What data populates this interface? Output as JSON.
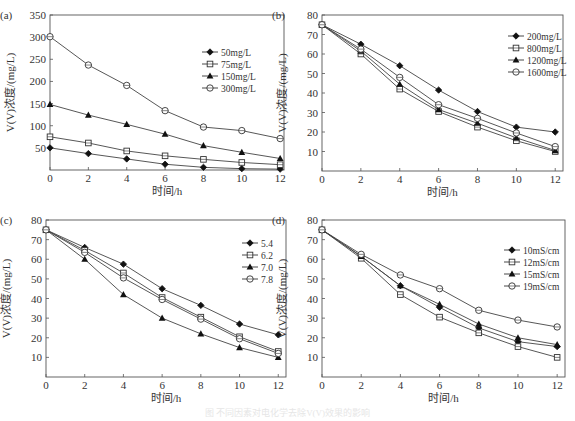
{
  "figure": {
    "caption": "图 不同因素对电化学去除V(V)效果的影响"
  },
  "chart_data": [
    {
      "type": "line",
      "panel_label": "(a)",
      "title": "",
      "xlabel": "时间/h",
      "ylabel": "V(V)浓度/(mg/L)",
      "x": [
        0,
        2,
        4,
        6,
        8,
        10,
        12
      ],
      "xticks": [
        0,
        2,
        4,
        6,
        8,
        10,
        12
      ],
      "yticks": [
        50,
        100,
        150,
        200,
        250,
        300,
        350
      ],
      "xlim": [
        0,
        12.2
      ],
      "ylim": [
        0,
        350
      ],
      "grid": false,
      "legend_position": "upper right",
      "box": {
        "left": 50,
        "top": 15,
        "right": 284,
        "bottom": 170
      },
      "legend_box": {
        "x": 202,
        "y": 52
      },
      "series": [
        {
          "name": "50mg/L",
          "marker": "diamond-filled",
          "values": [
            50,
            37,
            25,
            13,
            6,
            3,
            2
          ]
        },
        {
          "name": "75mg/L",
          "marker": "square-open",
          "values": [
            75,
            61,
            43,
            32,
            24,
            17,
            12
          ]
        },
        {
          "name": "150mg/L",
          "marker": "triangle-filled",
          "values": [
            148,
            124,
            103,
            81,
            55,
            40,
            26
          ]
        },
        {
          "name": "300mg/L",
          "marker": "circle-open",
          "values": [
            301,
            237,
            191,
            134,
            97,
            89,
            71
          ]
        }
      ]
    },
    {
      "type": "line",
      "panel_label": "(b)",
      "title": "",
      "xlabel": "时间/h",
      "ylabel": "V(V)浓度/(mg/L)",
      "x": [
        0,
        2,
        4,
        6,
        8,
        10,
        12
      ],
      "xticks": [
        0,
        2,
        4,
        6,
        8,
        10,
        12
      ],
      "yticks": [
        10,
        20,
        30,
        40,
        50,
        60,
        70,
        80
      ],
      "xlim": [
        0,
        12.4
      ],
      "ylim": [
        0,
        80
      ],
      "grid": false,
      "legend_position": "upper right",
      "box": {
        "left": 322,
        "top": 15,
        "right": 563,
        "bottom": 171
      },
      "legend_box": {
        "x": 508,
        "y": 36
      },
      "series": [
        {
          "name": "200mg/L",
          "marker": "diamond-filled",
          "values": [
            75,
            65,
            54,
            41.5,
            30.5,
            22.5,
            20
          ]
        },
        {
          "name": "800mg/L",
          "marker": "square-open",
          "values": [
            75,
            60,
            42,
            30.5,
            22.5,
            15.5,
            10
          ]
        },
        {
          "name": "1200mg/L",
          "marker": "triangle-filled",
          "values": [
            75,
            61.5,
            44.5,
            31.5,
            24.5,
            17,
            10.5
          ]
        },
        {
          "name": "1600mg/L",
          "marker": "circle-open",
          "values": [
            75,
            62.5,
            48,
            34,
            27,
            19.5,
            12.5
          ]
        }
      ]
    },
    {
      "type": "line",
      "panel_label": "(c)",
      "title": "",
      "xlabel": "时间/h",
      "ylabel": "V(V)浓度/(mg/L)",
      "x": [
        0,
        2,
        4,
        6,
        8,
        10,
        12
      ],
      "xticks": [
        0,
        2,
        4,
        6,
        8,
        10,
        12
      ],
      "yticks": [
        10,
        20,
        30,
        40,
        50,
        60,
        70,
        80
      ],
      "xlim": [
        0,
        12.4
      ],
      "ylim": [
        0,
        80
      ],
      "grid": false,
      "legend_position": "upper right",
      "box": {
        "left": 46,
        "top": 220,
        "right": 286,
        "bottom": 377
      },
      "legend_box": {
        "x": 242,
        "y": 243
      },
      "series": [
        {
          "name": "5.4",
          "marker": "diamond-filled",
          "values": [
            75,
            66,
            57.5,
            45,
            36.5,
            27,
            21.5
          ]
        },
        {
          "name": "6.2",
          "marker": "square-open",
          "values": [
            75,
            64.5,
            53,
            40.5,
            30.5,
            20.5,
            13
          ]
        },
        {
          "name": "7.0",
          "marker": "triangle-filled",
          "values": [
            75,
            60,
            42,
            30,
            22,
            15,
            10
          ]
        },
        {
          "name": "7.8",
          "marker": "circle-open",
          "values": [
            75,
            63.5,
            50.5,
            39.5,
            29.5,
            19.5,
            12
          ]
        }
      ]
    },
    {
      "type": "line",
      "panel_label": "(d)",
      "title": "",
      "xlabel": "时间/h",
      "ylabel": "V(V)浓度/(mg/L)",
      "x": [
        0,
        2,
        4,
        6,
        8,
        10,
        12
      ],
      "xticks": [
        0,
        2,
        4,
        6,
        8,
        10,
        12
      ],
      "yticks": [
        10,
        20,
        30,
        40,
        50,
        60,
        70,
        80
      ],
      "xlim": [
        0,
        12.4
      ],
      "ylim": [
        0,
        80
      ],
      "grid": false,
      "legend_position": "upper right",
      "box": {
        "left": 322,
        "top": 220,
        "right": 565,
        "bottom": 377
      },
      "legend_box": {
        "x": 504,
        "y": 250
      },
      "series": [
        {
          "name": "10mS/cm",
          "marker": "diamond-filled",
          "values": [
            75,
            61.5,
            46.5,
            35.5,
            25,
            18,
            15.5
          ]
        },
        {
          "name": "12mS/cm",
          "marker": "square-open",
          "values": [
            75,
            60.5,
            42,
            30.5,
            22.5,
            15.5,
            10
          ]
        },
        {
          "name": "15mS/cm",
          "marker": "triangle-filled",
          "values": [
            75,
            61.5,
            46.5,
            37,
            27,
            20,
            16.5
          ]
        },
        {
          "name": "19mS/cm",
          "marker": "circle-open",
          "values": [
            75,
            62.5,
            52,
            45,
            34,
            29,
            25.5
          ]
        }
      ]
    }
  ]
}
